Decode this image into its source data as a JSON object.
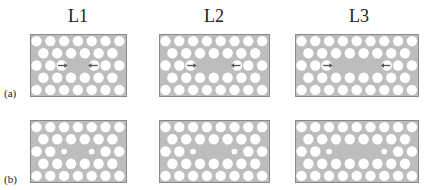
{
  "figure": {
    "columns": [
      {
        "label": "L1",
        "odd_row_count": 7,
        "even_row_count": 6,
        "cavity_missing": 1
      },
      {
        "label": "L2",
        "odd_row_count": 8,
        "even_row_count": 7,
        "cavity_missing": 2
      },
      {
        "label": "L3",
        "odd_row_count": 9,
        "even_row_count": 8,
        "cavity_missing": 3
      }
    ],
    "rows": [
      {
        "label": "(a)",
        "variant": "shifted-holes-with-arrows"
      },
      {
        "label": "(b)",
        "variant": "reduced-radius-holes"
      }
    ],
    "colors": {
      "slab": "#bdbdbd",
      "slab_border": "#8a8a8a",
      "hole": "#ffffff",
      "arrow": "#555555"
    }
  }
}
